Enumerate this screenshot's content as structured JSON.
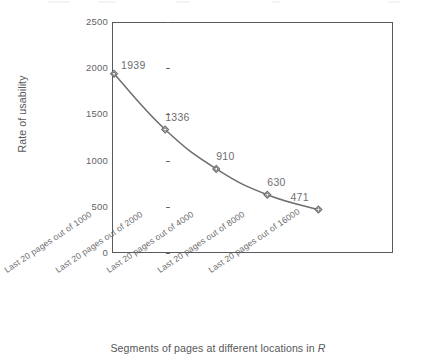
{
  "chart_data": {
    "type": "line",
    "title": "",
    "subtitle": "",
    "xlabel": "Segments of pages at different locations in R",
    "xlabel_plain": "Segments of pages at different locations in ",
    "xlabel_italic": "R",
    "ylabel": "Rate of usability",
    "categories": [
      "Last 20 pages out of 1000",
      "Last 20 pages out of 2000",
      "Last 20 pages out of 4000",
      "Last 20 pages out of 8000",
      "Last 20 pages out of 16000"
    ],
    "values": [
      1939,
      1336,
      910,
      630,
      471
    ],
    "point_labels": [
      "1939",
      "1336",
      "910",
      "630",
      "471"
    ],
    "ylim": [
      0,
      2500
    ],
    "yticks": [
      0,
      500,
      1000,
      1500,
      2000,
      2500
    ],
    "ytick_labels": [
      "0",
      "500",
      "1000",
      "1500",
      "2000",
      "2500"
    ],
    "grid": false,
    "legend": false,
    "legend_position": "none",
    "marker": "diamond",
    "line_color": "#6e6e70",
    "marker_color": "#6e6e70",
    "frame_color": "#5a5a5c",
    "text_color": "#58585a"
  },
  "axis": {
    "y_title": "Rate of usability",
    "x_title_prefix": "Segments of pages at different locations in ",
    "x_title_symbol": "R"
  }
}
